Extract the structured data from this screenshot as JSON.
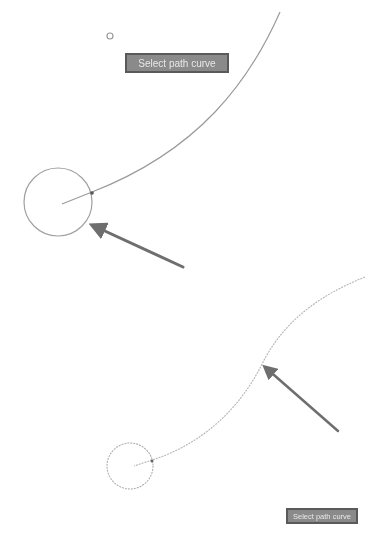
{
  "panels": {
    "top": {
      "label": "Select path curve",
      "colors": {
        "stroke": "#9a9a9a",
        "arrow": "#6e6e6e",
        "label_bg": "#8a8a8a",
        "label_border": "#5a5a5a"
      }
    },
    "bottom": {
      "label": "Select path curve",
      "colors": {
        "stroke": "#b5b5b5",
        "arrow": "#6e6e6e",
        "label_bg": "#8a8a8a",
        "label_border": "#5a5a5a"
      }
    }
  },
  "icons": {
    "marker": "small-circle-marker",
    "pointer": "arrow"
  }
}
